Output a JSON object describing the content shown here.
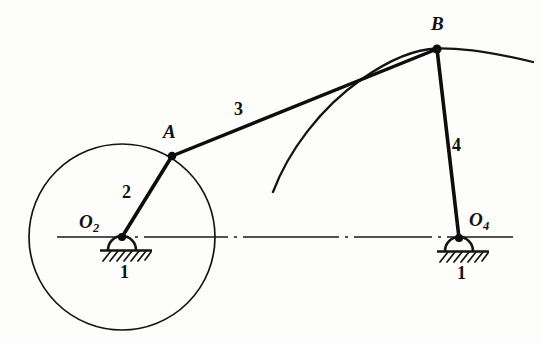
{
  "figure": {
    "background_color": "#fdfdfc",
    "ink_color": "#111111",
    "width": 541,
    "height": 344
  },
  "labels": {
    "point_a": "A",
    "point_b": "B",
    "pivot_o2_letter": "O",
    "pivot_o2_sub": "2",
    "pivot_o4_letter": "O",
    "pivot_o4_sub": "4",
    "link_2": "2",
    "link_3": "3",
    "link_4": "4",
    "ground_left": "1",
    "ground_right": "1"
  },
  "geometry": {
    "pivot_o2": {
      "x": 122,
      "y": 237
    },
    "pivot_o4": {
      "x": 459,
      "y": 238
    },
    "joint_a": {
      "x": 172,
      "y": 156
    },
    "joint_b": {
      "x": 437,
      "y": 49
    },
    "crank_circle": {
      "cx": 122,
      "cy": 237,
      "r": 93
    },
    "centerline": {
      "x1": 57,
      "x2": 526,
      "y": 237
    },
    "coupler_curve": {
      "start": {
        "x": 273,
        "y": 192
      },
      "end": {
        "x": 533,
        "y": 62
      },
      "apex_near": {
        "x": 437,
        "y": 49
      }
    },
    "ground_left_block": {
      "x": 100,
      "y": 237,
      "w": 52
    },
    "ground_right_block": {
      "x": 437,
      "y": 238,
      "w": 52
    }
  },
  "label_positions": {
    "point_a": {
      "left": 163,
      "top": 122
    },
    "point_b": {
      "left": 431,
      "top": 14
    },
    "pivot_o2": {
      "left": 79,
      "top": 212
    },
    "pivot_o4": {
      "left": 469,
      "top": 210
    },
    "link_2": {
      "left": 122,
      "top": 183
    },
    "link_3": {
      "left": 234,
      "top": 100
    },
    "link_4": {
      "left": 452,
      "top": 136
    },
    "ground_left": {
      "left": 120,
      "top": 263
    },
    "ground_right": {
      "left": 457,
      "top": 264
    }
  }
}
